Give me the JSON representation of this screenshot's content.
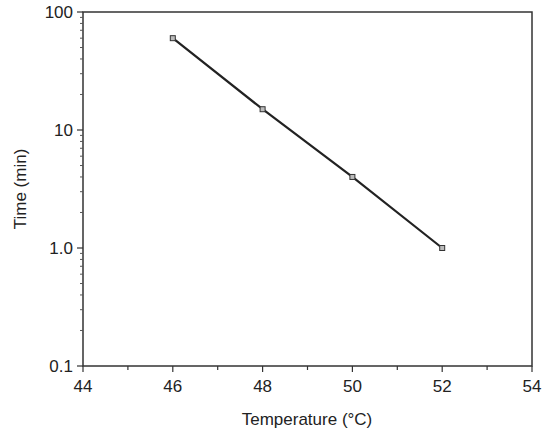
{
  "chart_data": {
    "type": "line",
    "title": "",
    "xlabel": "Temperature (°C)",
    "ylabel": "Time (min)",
    "xlim": [
      44,
      54
    ],
    "ylim": [
      0.1,
      100
    ],
    "yscale": "log",
    "grid": false,
    "legend": null,
    "x_ticks": [
      44,
      46,
      48,
      50,
      52,
      54
    ],
    "x_tick_labels": [
      "44",
      "46",
      "48",
      "50",
      "52",
      "54"
    ],
    "y_ticks": [
      0.1,
      1.0,
      10,
      100
    ],
    "y_tick_labels": [
      "0.1",
      "1.0",
      "10",
      "100"
    ],
    "series": [
      {
        "name": "Time vs Temperature",
        "marker": "square",
        "color": "#222222",
        "x": [
          46,
          48,
          50,
          52
        ],
        "y": [
          60,
          15,
          4,
          1.0
        ]
      }
    ]
  },
  "axes": {
    "xlabel": "Temperature (°C)",
    "ylabel": "Time (min)"
  }
}
